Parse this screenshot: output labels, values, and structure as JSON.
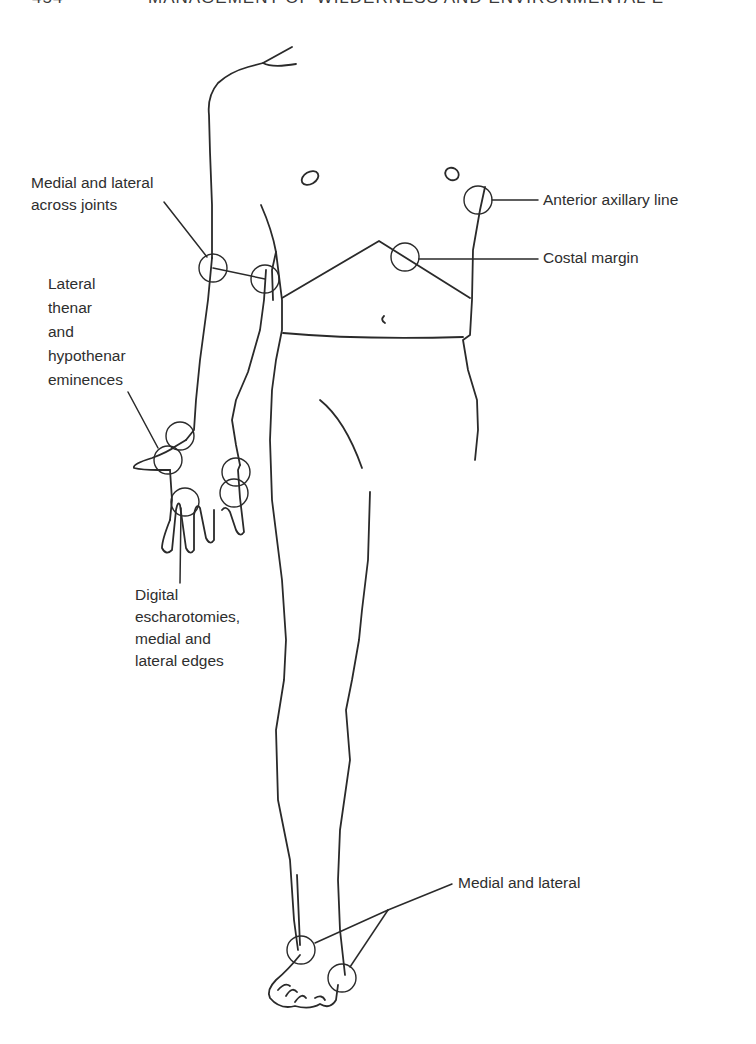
{
  "page_header": {
    "page_number": "454",
    "running_title": "MANAGEMENT OF WILDERNESS AND ENVIRONMENTAL E"
  },
  "figure": {
    "line_color": "#2a2a2a",
    "background": "#ffffff"
  },
  "labels": {
    "elbow_joints": [
      "Medial and lateral",
      "across joints"
    ],
    "hand_eminences": [
      "Lateral",
      "thenar",
      "and",
      "hypothenar",
      "eminences"
    ],
    "digital": [
      "Digital",
      "escharotomies,",
      "medial and",
      "lateral edges"
    ],
    "anterior_axillary": "Anterior axillary line",
    "costal_margin": "Costal margin",
    "ankle": "Medial and lateral"
  }
}
